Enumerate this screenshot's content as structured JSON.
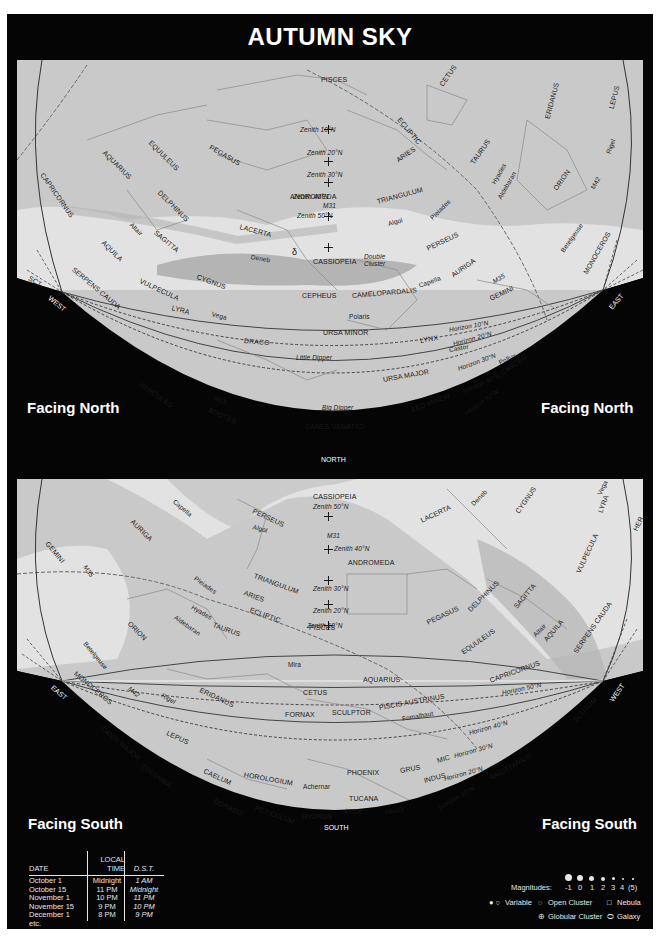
{
  "title": "AUTUMN SKY",
  "colors": {
    "background": "#050505",
    "sky_fill": "#c9c9c9",
    "milky_way": "#e2e2e2",
    "milky_way_dark": "#b4b4b4",
    "text": "#1a1a1a",
    "white_text": "#ffffff"
  },
  "north_map": {
    "facing_left": "Facing North",
    "facing_right": "Facing North",
    "directions": {
      "west": "WEST",
      "east": "EAST",
      "north": "NORTH",
      "sct": "SCT"
    },
    "constellations": [
      "PISCES",
      "CETUS",
      "ECLIPTIC",
      "ERIDANUS",
      "LEPUS",
      "CAPRICORNUS",
      "AQUARIUS",
      "EQUULEUS",
      "PEGASUS",
      "ARIES",
      "TAURUS",
      "ANDROMEDA",
      "TRIANGULUM",
      "ORION",
      "DELPHINUS",
      "LACERTA",
      "SAGITTA",
      "AQUILA",
      "PERSEUS",
      "SERPENS CAUDA",
      "CASSIOPEIA",
      "AURIGA",
      "VULPECULA",
      "CYGNUS",
      "MONOCEROS",
      "CEPHEUS",
      "CAMELOPARDALIS",
      "GEMINI",
      "LYRA",
      "URSA MINOR",
      "DRACO",
      "LYNX",
      "HERCULES",
      "URSA MAJOR",
      "CANCER",
      "BOOTES",
      "LEO MINOR",
      "CANES VENATICI"
    ],
    "stars": [
      "Rigel",
      "Hyades",
      "Aldebaran",
      "Pleiades",
      "Algol",
      "Altair",
      "Deneb",
      "Betelgeuse",
      "M42",
      "M31",
      "Double Cluster",
      "Capella",
      "M35",
      "Polaris",
      "Vega",
      "Castor",
      "Pollux",
      "Little Dipper",
      "M13",
      "Big Dipper",
      "δ"
    ],
    "zeniths": [
      "Zenith 10°N",
      "Zenith 20°N",
      "Zenith 30°N",
      "Zenith 40°N",
      "Zenith 50°N"
    ],
    "horizons": [
      "Horizon 10°N",
      "Horizon 20°N",
      "Horizon 30°N",
      "Horizon 40°N",
      "Horizon 50°N"
    ]
  },
  "south_map": {
    "facing_left": "Facing South",
    "facing_right": "Facing South",
    "directions": {
      "west": "WEST",
      "east": "EAST",
      "south": "SOUTH",
      "her": "HER"
    },
    "constellations": [
      "CASSIOPEIA",
      "PERSEUS",
      "AURIGA",
      "LACERTA",
      "CYGNUS",
      "LYRA",
      "GEMINI",
      "ANDROMEDA",
      "TRIANGULUM",
      "ARIES",
      "ECLIPTIC",
      "VULPECULA",
      "ORION",
      "TAURUS",
      "PISCES",
      "PEGASUS",
      "DELPHINUS",
      "SAGITTA",
      "AQUILA",
      "EQUULEUS",
      "SERPENS CAUDA",
      "MONOCEROS",
      "ERIDANUS",
      "CETUS",
      "AQUARIUS",
      "CAPRICORNUS",
      "PISCIS AUSTRINUS",
      "FORNAX",
      "SCULPTOR",
      "SCUTUM",
      "CANIS MAJOR",
      "LEPUS",
      "COLUMBA",
      "CAELUM",
      "HOROLOGIUM",
      "PHOENIX",
      "GRUS",
      "MIC",
      "INDUS",
      "SAGITTARIUS",
      "DORADO",
      "RETICULUM",
      "HYDRUS",
      "TUCANA",
      "PAVO"
    ],
    "stars": [
      "Capella",
      "Deneb",
      "Vega",
      "Algol",
      "M31",
      "M35",
      "Pleiades",
      "Hyades",
      "Aldebaran",
      "Betelgeuse",
      "Mira",
      "Altair",
      "M42",
      "Rigel",
      "Fomalhaut",
      "Achernar",
      "47 tuc"
    ],
    "zeniths": [
      "Zenith 50°N",
      "Zenith 40°N",
      "Zenith 30°N",
      "Zenith 20°N",
      "Zenith 10°N"
    ],
    "horizons": [
      "Horizon 50°N",
      "Horizon 40°N",
      "Horizon 30°N",
      "Horizon 20°N",
      "Horizon 10°N"
    ]
  },
  "time_table": {
    "headers": {
      "date": "DATE",
      "local_time_1": "LOCAL",
      "local_time_2": "TIME",
      "dst": "D.S.T."
    },
    "rows": [
      {
        "date": "October 1",
        "local": "Midnight",
        "dst": "1 AM"
      },
      {
        "date": "October 15",
        "local": "11 PM",
        "dst": "Midnight"
      },
      {
        "date": "November 1",
        "local": "10 PM",
        "dst": "11 PM"
      },
      {
        "date": "November 15",
        "local": "9 PM",
        "dst": "10 PM"
      },
      {
        "date": "December 1",
        "local": "8 PM",
        "dst": "9 PM"
      },
      {
        "date": "etc.",
        "local": "",
        "dst": ""
      }
    ]
  },
  "legend": {
    "magnitudes_label": "Magnitudes:",
    "magnitudes": [
      "-1",
      "0",
      "1",
      "2",
      "3",
      "4",
      "(5)"
    ],
    "variable": "Variable",
    "open_cluster": "Open Cluster",
    "nebula": "Nebula",
    "globular_cluster": "Globular Cluster",
    "galaxy": "Galaxy"
  }
}
